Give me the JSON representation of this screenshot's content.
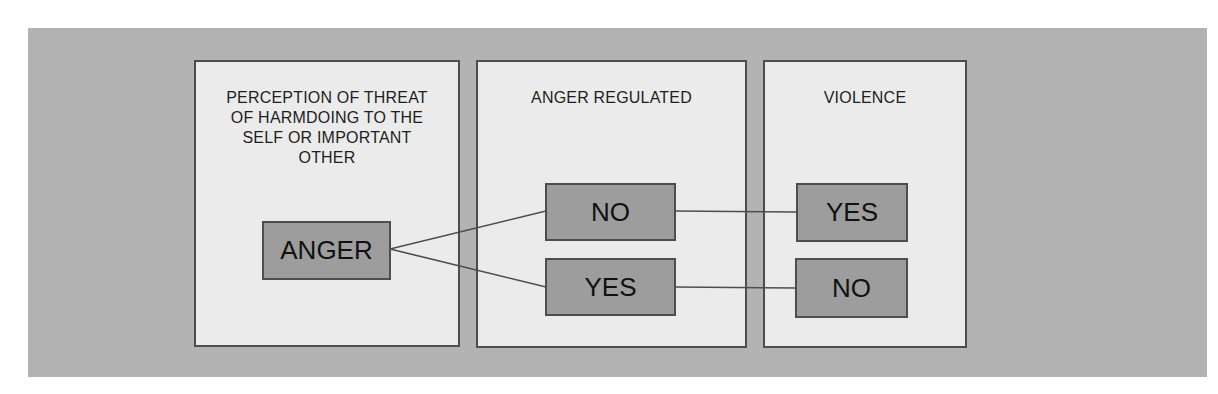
{
  "diagram": {
    "panels": [
      {
        "id": "perception",
        "title": "PERCEPTION OF THREAT\nOF HARMDOING TO THE\nSELF OR IMPORTANT\nOTHER"
      },
      {
        "id": "regulated",
        "title": "ANGER REGULATED"
      },
      {
        "id": "violence",
        "title": "VIOLENCE"
      }
    ],
    "nodes": {
      "anger": "ANGER",
      "regulated_no": "NO",
      "regulated_yes": "YES",
      "violence_yes": "YES",
      "violence_no": "NO"
    },
    "edges": [
      {
        "from": "anger",
        "to": "regulated_no"
      },
      {
        "from": "anger",
        "to": "regulated_yes"
      },
      {
        "from": "regulated_no",
        "to": "violence_yes"
      },
      {
        "from": "regulated_yes",
        "to": "violence_no"
      }
    ],
    "colors": {
      "background": "#b3b3b3",
      "panel_fill": "#ebebeb",
      "node_fill": "#9d9d9d",
      "stroke": "#4d4d4d"
    }
  }
}
